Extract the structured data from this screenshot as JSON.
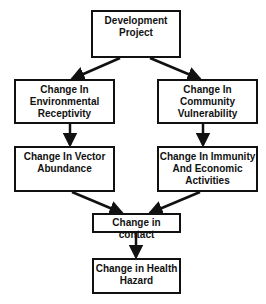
{
  "diagram": {
    "nodes": [
      {
        "id": "development-project",
        "lines": [
          "Development",
          "Project"
        ]
      },
      {
        "id": "environmental-receptivity",
        "lines": [
          "Change In",
          "Environmental",
          "Receptivity"
        ]
      },
      {
        "id": "community-vulnerability",
        "lines": [
          "Change In",
          "Community",
          "Vulnerability"
        ]
      },
      {
        "id": "vector-abundance",
        "lines": [
          "Change In Vector",
          "Abundance"
        ]
      },
      {
        "id": "immunity-economic",
        "lines": [
          "Change In Immunity",
          "And Economic",
          "Activities"
        ]
      },
      {
        "id": "contact",
        "lines": [
          "Change in contact"
        ]
      },
      {
        "id": "health-hazard",
        "lines": [
          "Change in Health",
          "Hazard"
        ]
      }
    ],
    "edges": [
      {
        "from": "development-project",
        "to": "environmental-receptivity"
      },
      {
        "from": "development-project",
        "to": "community-vulnerability"
      },
      {
        "from": "environmental-receptivity",
        "to": "vector-abundance"
      },
      {
        "from": "community-vulnerability",
        "to": "immunity-economic"
      },
      {
        "from": "vector-abundance",
        "to": "contact"
      },
      {
        "from": "immunity-economic",
        "to": "contact"
      },
      {
        "from": "contact",
        "to": "health-hazard"
      }
    ],
    "colors": {
      "stroke": "#111111",
      "background": "#ffffff",
      "text": "#111111"
    }
  }
}
